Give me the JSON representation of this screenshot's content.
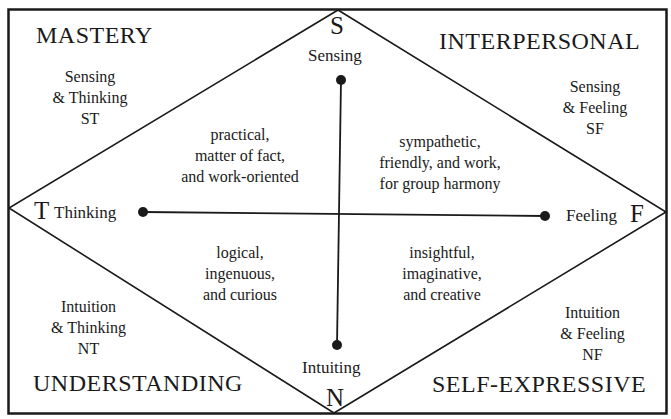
{
  "quadrants": {
    "mastery": {
      "title": "MASTERY",
      "line1": "Sensing",
      "line2": "& Thinking",
      "code": "ST",
      "desc": [
        "practical,",
        "matter of fact,",
        "and work-oriented"
      ]
    },
    "interpersonal": {
      "title": "INTERPERSONAL",
      "line1": "Sensing",
      "line2": "& Feeling",
      "code": "SF",
      "desc": [
        "sympathetic,",
        "friendly, and work,",
        "for group harmony"
      ]
    },
    "understanding": {
      "title": "UNDERSTANDING",
      "line1": "Intuition",
      "line2": "& Thinking",
      "code": "NT",
      "desc": [
        "logical,",
        "ingenuous,",
        "and curious"
      ]
    },
    "self_expressive": {
      "title": "SELF-EXPRESSIVE",
      "line1": "Intuition",
      "line2": "& Feeling",
      "code": "NF",
      "desc": [
        "insightful,",
        "imaginative,",
        "and creative"
      ]
    }
  },
  "axes": {
    "top": {
      "letter": "S",
      "label": "Sensing"
    },
    "bottom": {
      "letter": "N",
      "label": "Intuiting"
    },
    "left": {
      "letter": "T",
      "label": "Thinking"
    },
    "right": {
      "letter": "F",
      "label": "Feeling"
    }
  },
  "colors": {
    "line": "#1a1a1a",
    "background": "#ffffff"
  }
}
